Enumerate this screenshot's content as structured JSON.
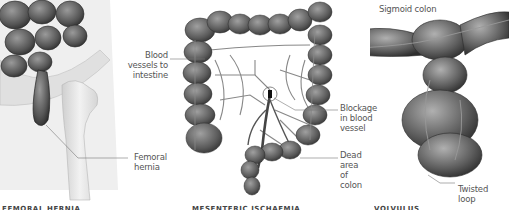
{
  "panels": [
    {
      "id": "femoral-hernia",
      "labels": [
        {
          "text_lines": [
            "Femoral",
            "hernia"
          ]
        }
      ],
      "caption": "FEMORAL HERNIA"
    },
    {
      "id": "mesenteric-ischaemia",
      "labels": [
        {
          "text_lines": [
            "Blood",
            "vessels to",
            "intestine"
          ]
        },
        {
          "text_lines": [
            "Blockage",
            "in blood",
            "vessel"
          ]
        },
        {
          "text_lines": [
            "Dead area",
            "of colon"
          ]
        }
      ],
      "caption": "MESENTERIC ISCHAEMIA"
    },
    {
      "id": "volvulus",
      "labels": [
        {
          "text_lines": [
            "Sigmoid colon"
          ]
        },
        {
          "text_lines": [
            "Twisted",
            "loop"
          ]
        }
      ],
      "caption": "VOLVULUS"
    }
  ],
  "colors": {
    "background": "#ffffff",
    "label_text": "#555555",
    "leader_line": "#777777",
    "tissue_dark": "#4a4a4a",
    "tissue_mid": "#7a7a7a",
    "bone": "#e6e6e6"
  }
}
